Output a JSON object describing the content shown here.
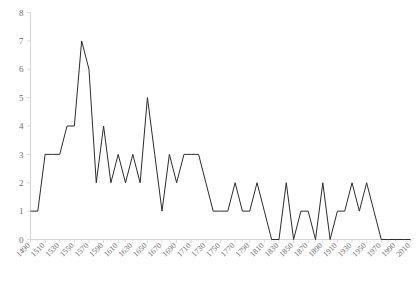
{
  "chart_data": {
    "type": "line",
    "title": "",
    "subtitle": "",
    "xlabel": "",
    "ylabel": "",
    "xlim": [
      1490,
      2010
    ],
    "ylim": [
      0,
      8
    ],
    "grid": false,
    "legend": null,
    "y_ticks": [
      0,
      1,
      2,
      3,
      4,
      5,
      6,
      7,
      8
    ],
    "y_tick_labels": [
      "0",
      "1",
      "2",
      "3",
      "4",
      "5",
      "6",
      "7",
      "8"
    ],
    "x_tick_labels": [
      "1490",
      "1510",
      "1530",
      "1550",
      "1570",
      "1590",
      "1610",
      "1630",
      "1650",
      "1670",
      "1690",
      "1710",
      "1730",
      "1750",
      "1770",
      "1790",
      "1810",
      "1830",
      "1850",
      "1870",
      "1890",
      "1910",
      "1930",
      "1950",
      "1970",
      "1990",
      "2010"
    ],
    "x_tick_values": [
      1490,
      1510,
      1530,
      1550,
      1570,
      1590,
      1610,
      1630,
      1650,
      1670,
      1690,
      1710,
      1730,
      1750,
      1770,
      1790,
      1810,
      1830,
      1850,
      1870,
      1890,
      1910,
      1930,
      1950,
      1970,
      1990,
      2010
    ],
    "x_minor_step": 10,
    "line_color": "#2b2b2b",
    "axis_color": "#cfcfcf",
    "tick_label_color": "#6b6b6b",
    "x": [
      1490,
      1500,
      1510,
      1520,
      1530,
      1540,
      1550,
      1560,
      1570,
      1580,
      1590,
      1600,
      1610,
      1620,
      1630,
      1640,
      1650,
      1660,
      1670,
      1680,
      1690,
      1700,
      1710,
      1720,
      1730,
      1740,
      1750,
      1760,
      1770,
      1780,
      1790,
      1800,
      1810,
      1820,
      1830,
      1840,
      1850,
      1860,
      1870,
      1880,
      1890,
      1900,
      1910,
      1920,
      1930,
      1940,
      1950,
      1960,
      1970,
      1980,
      1990,
      2000,
      2010
    ],
    "values": [
      1,
      1,
      3,
      3,
      3,
      4,
      4,
      7,
      6,
      2,
      4,
      2,
      3,
      2,
      3,
      2,
      5,
      3,
      1,
      3,
      2,
      3,
      3,
      3,
      2,
      1,
      1,
      1,
      2,
      1,
      1,
      2,
      1,
      0,
      0,
      2,
      0,
      1,
      1,
      0,
      2,
      0,
      1,
      1,
      2,
      1,
      2,
      1,
      0,
      0,
      0,
      0,
      0
    ],
    "series": [
      {
        "name": "count",
        "values": [
          1,
          1,
          3,
          3,
          3,
          4,
          4,
          7,
          6,
          2,
          4,
          2,
          3,
          2,
          3,
          2,
          5,
          3,
          1,
          3,
          2,
          3,
          3,
          3,
          2,
          1,
          1,
          1,
          2,
          1,
          1,
          2,
          1,
          0,
          0,
          2,
          0,
          1,
          1,
          0,
          2,
          0,
          1,
          1,
          2,
          1,
          2,
          1,
          0,
          0,
          0,
          0,
          0
        ]
      }
    ]
  }
}
